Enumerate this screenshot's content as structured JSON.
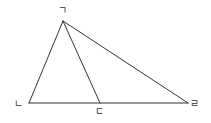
{
  "diagram": {
    "type": "triangle-with-cevian",
    "stroke_color": "#333333",
    "background": "#ffffff",
    "points": {
      "A": {
        "label": "ㄱ",
        "x": 63,
        "y": 21
      },
      "B": {
        "label": "ㄴ",
        "x": 29,
        "y": 103
      },
      "C": {
        "label": "ㄷ",
        "x": 100,
        "y": 103
      },
      "D": {
        "label": "ㄹ",
        "x": 188,
        "y": 103
      }
    },
    "segments": [
      [
        "ㄱ",
        "ㄴ"
      ],
      [
        "ㄱ",
        "ㄷ"
      ],
      [
        "ㄱ",
        "ㄹ"
      ],
      [
        "ㄴ",
        "ㄹ"
      ]
    ],
    "labels": {
      "apex": "ㄱ",
      "left": "ㄴ",
      "middle": "ㄷ",
      "right": "ㄹ"
    }
  }
}
